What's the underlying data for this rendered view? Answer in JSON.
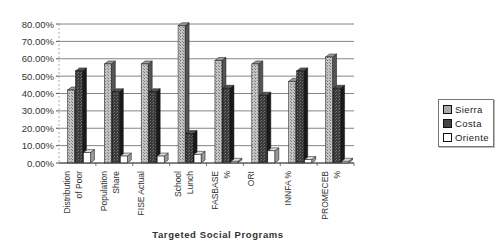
{
  "chart_data": {
    "type": "bar",
    "style": "3d-clustered-column",
    "title": "",
    "xlabel": "Targeted Social Programs",
    "ylabel": "",
    "ylim": [
      0,
      0.8
    ],
    "yticks": [
      "0.00%",
      "10.00%",
      "20.00%",
      "30.00%",
      "40.00%",
      "50.00%",
      "60.00%",
      "70.00%",
      "80.00%"
    ],
    "grid": true,
    "legend_position": "right",
    "categories": [
      [
        "Distribution",
        "of Poor"
      ],
      [
        "Population",
        "Share"
      ],
      [
        "FISE Actual"
      ],
      [
        "School",
        "Lunch"
      ],
      [
        "FASBASE",
        "%"
      ],
      [
        "ORI"
      ],
      [
        "INNFA %"
      ],
      [
        "PROMECEB",
        "%"
      ]
    ],
    "series": [
      {
        "name": "Sierra",
        "color": "#b8b8b8",
        "values": [
          0.42,
          0.57,
          0.57,
          0.79,
          0.59,
          0.57,
          0.47,
          0.61
        ]
      },
      {
        "name": "Costa",
        "color": "#333333",
        "values": [
          0.53,
          0.41,
          0.41,
          0.17,
          0.43,
          0.39,
          0.53,
          0.43
        ]
      },
      {
        "name": "Oriente",
        "color": "#ffffff",
        "values": [
          0.06,
          0.04,
          0.04,
          0.05,
          0.01,
          0.07,
          0.02,
          0.01
        ]
      }
    ]
  },
  "legend": {
    "items": [
      "Sierra",
      "Costa",
      "Oriente"
    ]
  }
}
